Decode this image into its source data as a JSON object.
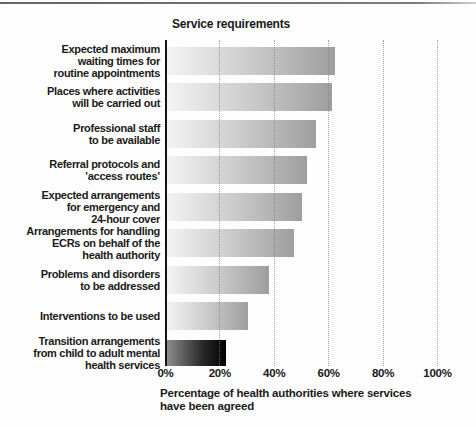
{
  "chart_data": {
    "type": "bar",
    "orientation": "horizontal",
    "title": "Service requirements",
    "categories": [
      "Expected maximum\nwaiting times for\nroutine appointments",
      "Places where activities\nwill be carried out",
      "Professional staff\nto be available",
      "Referral protocols and\n’access routes’",
      "Expected arrangements\nfor emergency and\n24-hour cover",
      "Arrangements for handling\nECRs on behalf of the\nhealth authority",
      "Problems and disorders\nto be addressed",
      "Interventions to be used",
      "Transition arrangements\nfrom child to adult mental\nhealth services"
    ],
    "values": [
      62,
      61,
      55,
      52,
      50,
      47,
      38,
      30,
      22
    ],
    "dark_bar_index": 8,
    "xlabel": "Percentage of health authorities where services\nhave been agreed",
    "xticks": [
      "0%",
      "20%",
      "40%",
      "60%",
      "80%",
      "100%"
    ],
    "xlim": [
      0,
      100
    ],
    "grid": "vertical-dotted",
    "legend": "none",
    "colors": {
      "bar_gradient_start": "#f4f4f4",
      "bar_gradient_end": "#9e9e9e",
      "dark_bar_gradient_start": "#8f8f8f",
      "dark_bar_gradient_end": "#000000",
      "axis": "#111111",
      "grid": "#828282",
      "text": "#1a1a1a"
    }
  }
}
